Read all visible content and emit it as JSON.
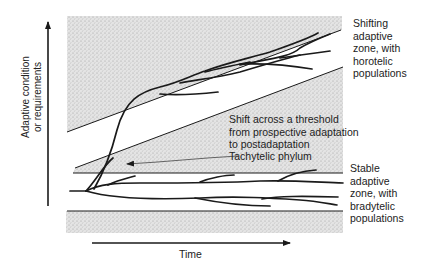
{
  "diagram": {
    "type": "evolutionary-adaptive-zones",
    "y_axis_label_line1": "Adaptive condition",
    "y_axis_label_line2": "or requirements",
    "x_axis_label": "Time",
    "labels": {
      "shifting_zone": [
        "Shifting",
        "adaptive",
        "zone, with",
        "horotelic",
        "populations"
      ],
      "threshold": [
        "Shift across a threshold",
        "from prospective adaptation",
        "to postadaptation"
      ],
      "tachytelic": "Tachytelic phylum",
      "stable_zone": [
        "Stable",
        "adaptive",
        "zone, with",
        "bradytelic",
        "populations"
      ]
    },
    "colors": {
      "line": "#1a1a1a",
      "stipple_bg": "#dcdcdc",
      "stipple_dot": "#9a9a9a",
      "text": "#222222"
    }
  }
}
